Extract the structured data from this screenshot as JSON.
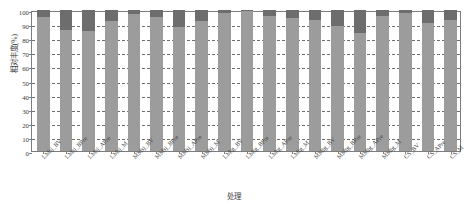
{
  "chart_data": {
    "type": "bar",
    "stacked": true,
    "title": "",
    "xlabel": "处理",
    "ylabel": "相对丰度(%)",
    "ylim": [
      0,
      100
    ],
    "yticks": [
      0,
      10,
      20,
      30,
      40,
      50,
      60,
      70,
      80,
      90,
      100
    ],
    "grid": true,
    "legend": "none",
    "categories": [
      "LMsj_BV",
      "LMsj_BPre",
      "LMsj_APre",
      "LMsj_M",
      "MMsj_BV",
      "MMsj_BPre",
      "MMsj_APre",
      "MMsj_M",
      "LMtg_BV",
      "LMtg_BPre",
      "LMtg_APre",
      "LMtg_M",
      "MMtg_BV",
      "MMtg_BPre",
      "MMtg_APre",
      "MMtg_M",
      "CS_BV",
      "CS_APre",
      "CS_M"
    ],
    "series": [
      {
        "name": "dominant-taxon",
        "color": "#9c9c9c",
        "values": [
          95,
          86,
          85,
          92,
          97,
          95,
          88,
          92,
          98,
          99,
          96,
          94,
          93,
          89,
          84,
          96,
          98,
          91,
          93
        ]
      },
      {
        "name": "minor-taxon",
        "color": "#6d6d6d",
        "values": [
          5,
          14,
          15,
          8,
          3,
          5,
          12,
          8,
          2,
          1,
          4,
          6,
          7,
          11,
          16,
          4,
          2,
          9,
          7
        ]
      }
    ],
    "group_boundaries": [
      "LMsj",
      "MMsj",
      "LMtg",
      "MMtg",
      "CS"
    ]
  }
}
